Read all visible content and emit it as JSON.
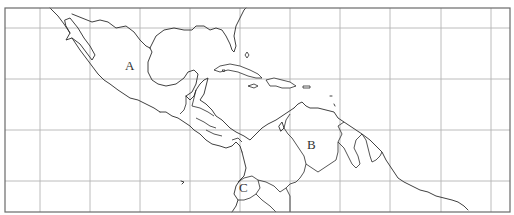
{
  "map": {
    "title": "",
    "region": "Central America, Caribbean and northern South America",
    "colors": {
      "background": "#ffffff",
      "graticule": "#b4b4b4",
      "frame": "#6a6a6a",
      "outline": "#2a2a2a",
      "label": "#333333"
    },
    "frame": {
      "x": 5,
      "y": 8,
      "width": 505,
      "height": 204
    },
    "graticule": {
      "vertical_x": [
        40,
        90,
        140,
        190,
        240,
        290,
        340,
        390,
        441,
        491
      ],
      "horizontal_y": [
        28,
        79,
        130,
        181
      ]
    },
    "labels": [
      {
        "id": "A",
        "text": "A",
        "x": 125,
        "y": 70
      },
      {
        "id": "B",
        "text": "B",
        "x": 307,
        "y": 149
      },
      {
        "id": "C",
        "text": "C",
        "x": 239,
        "y": 192
      }
    ]
  }
}
